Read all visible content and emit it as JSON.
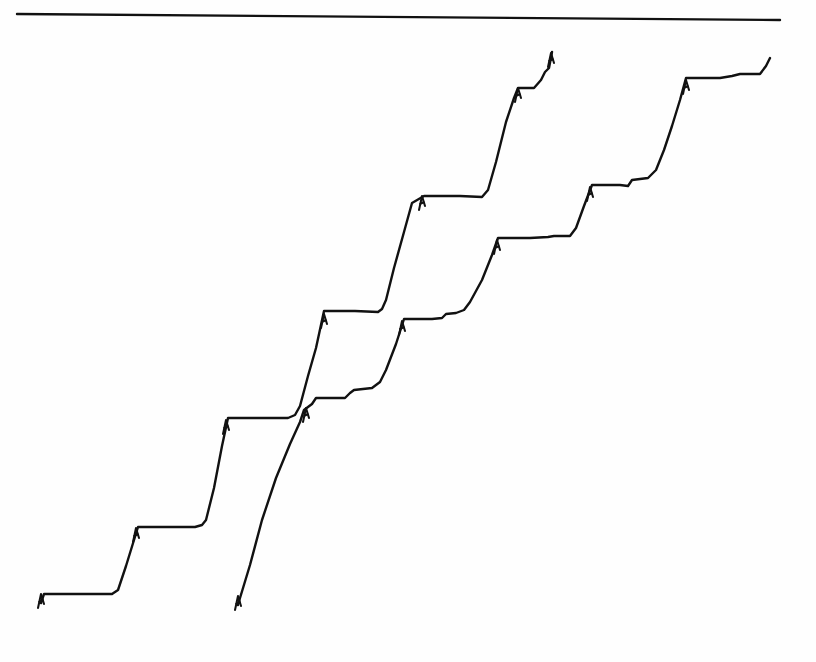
{
  "figure": {
    "background": "#fefefe",
    "ink_color": "#111111",
    "stroke_width": 2.4
  },
  "chart_data": {
    "type": "line",
    "title": "",
    "xlabel": "",
    "ylabel": "",
    "grid": false,
    "legend": null,
    "coordinate_space": "pixel",
    "xlim": [
      0,
      816
    ],
    "ylim": [
      662,
      0
    ],
    "reference_lines": [
      {
        "name": "top-baseline",
        "points": [
          [
            17,
            14
          ],
          [
            780,
            20
          ]
        ]
      }
    ],
    "series": [
      {
        "name": "staircase-trace-1",
        "points": [
          [
            41,
            603
          ],
          [
            44,
            594
          ],
          [
            50,
            594
          ],
          [
            80,
            594
          ],
          [
            102,
            594
          ],
          [
            112,
            594
          ],
          [
            118,
            590
          ],
          [
            126,
            566
          ],
          [
            134,
            540
          ],
          [
            138,
            527
          ],
          [
            170,
            527
          ],
          [
            195,
            527
          ],
          [
            202,
            525
          ],
          [
            206,
            520
          ],
          [
            214,
            488
          ],
          [
            222,
            446
          ],
          [
            228,
            418
          ],
          [
            260,
            418
          ],
          [
            288,
            418
          ],
          [
            295,
            415
          ],
          [
            300,
            406
          ],
          [
            308,
            376
          ],
          [
            316,
            348
          ],
          [
            324,
            311
          ],
          [
            355,
            311
          ],
          [
            378,
            312
          ],
          [
            382,
            309
          ],
          [
            386,
            300
          ],
          [
            394,
            268
          ],
          [
            404,
            232
          ],
          [
            412,
            203
          ],
          [
            424,
            196
          ],
          [
            460,
            196
          ],
          [
            482,
            197
          ],
          [
            488,
            190
          ],
          [
            496,
            162
          ],
          [
            506,
            122
          ],
          [
            514,
            98
          ],
          [
            518,
            88
          ],
          [
            534,
            88
          ],
          [
            541,
            80
          ],
          [
            545,
            72
          ],
          [
            549,
            68
          ],
          [
            552,
            52
          ]
        ],
        "step_markers": [
          [
            41,
            598
          ],
          [
            136,
            532
          ],
          [
            226,
            424
          ],
          [
            324,
            318
          ],
          [
            422,
            200
          ],
          [
            518,
            92
          ],
          [
            551,
            57
          ]
        ]
      },
      {
        "name": "staircase-trace-2",
        "points": [
          [
            238,
            605
          ],
          [
            240,
            598
          ],
          [
            250,
            565
          ],
          [
            262,
            520
          ],
          [
            276,
            478
          ],
          [
            290,
            444
          ],
          [
            300,
            422
          ],
          [
            304,
            410
          ],
          [
            312,
            404
          ],
          [
            316,
            398
          ],
          [
            345,
            398
          ],
          [
            350,
            393
          ],
          [
            354,
            390
          ],
          [
            372,
            388
          ],
          [
            380,
            382
          ],
          [
            386,
            370
          ],
          [
            396,
            344
          ],
          [
            404,
            319
          ],
          [
            432,
            319
          ],
          [
            442,
            318
          ],
          [
            446,
            314
          ],
          [
            456,
            313
          ],
          [
            464,
            310
          ],
          [
            470,
            302
          ],
          [
            482,
            280
          ],
          [
            492,
            255
          ],
          [
            498,
            238
          ],
          [
            530,
            238
          ],
          [
            548,
            237
          ],
          [
            554,
            236
          ],
          [
            570,
            236
          ],
          [
            576,
            228
          ],
          [
            584,
            206
          ],
          [
            592,
            185
          ],
          [
            620,
            185
          ],
          [
            628,
            186
          ],
          [
            632,
            180
          ],
          [
            648,
            178
          ],
          [
            656,
            170
          ],
          [
            664,
            150
          ],
          [
            672,
            126
          ],
          [
            680,
            100
          ],
          [
            686,
            78
          ],
          [
            720,
            78
          ],
          [
            732,
            76
          ],
          [
            740,
            74
          ],
          [
            760,
            74
          ],
          [
            766,
            66
          ],
          [
            770,
            58
          ]
        ],
        "step_markers": [
          [
            238,
            600
          ],
          [
            306,
            412
          ],
          [
            402,
            325
          ],
          [
            497,
            244
          ],
          [
            590,
            191
          ],
          [
            686,
            84
          ]
        ]
      }
    ]
  }
}
